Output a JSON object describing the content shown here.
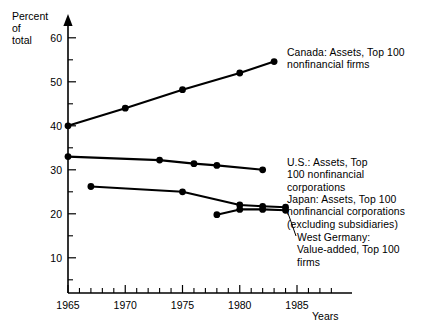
{
  "chart_data": {
    "type": "line",
    "title": "",
    "subtitle": "",
    "xlabel": "Years",
    "ylabel": "Percent\nof\ntotal",
    "xlim": [
      1964.2,
      1988.5
    ],
    "ylim": [
      2,
      62
    ],
    "grid": false,
    "legend_position": "right-inline-annotations",
    "y_ticks_major": [
      10,
      20,
      30,
      40,
      50,
      60
    ],
    "y_ticks_minor": [
      5,
      15,
      25,
      35,
      45,
      55
    ],
    "y_tick_labels": [
      "10",
      "20",
      "30",
      "40",
      "50",
      "60"
    ],
    "x_ticks_major": [
      1965,
      1970,
      1975,
      1980,
      1985
    ],
    "x_tick_labels": [
      "1965",
      "1970",
      "1975",
      "1980",
      "1985"
    ],
    "x_ticks_minor": [
      1966,
      1967,
      1968,
      1969,
      1971,
      1972,
      1973,
      1974,
      1976,
      1977,
      1978,
      1979,
      1981,
      1982,
      1983,
      1984,
      1986,
      1987,
      1988
    ],
    "series": [
      {
        "name": "Canada: Assets, Top 100 nonfinancial firms",
        "label": "Canada: Assets, Top 100\nnonfinancial firms",
        "color": "#000000",
        "x": [
          1965,
          1970,
          1975,
          1980,
          1983
        ],
        "values": [
          40.0,
          44.0,
          48.2,
          52.0,
          54.6
        ]
      },
      {
        "name": "U.S.: Assets, Top 100 nonfinancial corporations",
        "label": "U.S.: Assets, Top\n100 nonfinancial\ncorporations",
        "color": "#000000",
        "x": [
          1965,
          1973,
          1976,
          1978,
          1982
        ],
        "values": [
          33.0,
          32.2,
          31.4,
          31.0,
          30.0
        ]
      },
      {
        "name": "Japan: Assets, Top 100 nonfinancial corporations (excluding subsidiaries)",
        "label": "Japan: Assets, Top 100\nnonfinancial corporations\n(excluding subsidiaries)",
        "color": "#000000",
        "x": [
          1967,
          1975,
          1980,
          1982,
          1984
        ],
        "values": [
          26.2,
          25.0,
          22.0,
          21.7,
          21.5
        ]
      },
      {
        "name": "West Germany: Value-added, Top 100 firms",
        "label": "West Germany:\nValue-added, Top 100\nfirms",
        "color": "#000000",
        "x": [
          1978,
          1980,
          1982,
          1984
        ],
        "values": [
          19.8,
          21.0,
          21.0,
          20.8
        ]
      }
    ]
  },
  "annotations": {
    "canada": "Canada: Assets, Top 100\nnonfinancial firms",
    "us": "U.S.: Assets, Top\n100 nonfinancial\ncorporations",
    "japan": "Japan: Assets, Top 100\nnonfinancial corporations\n(excluding subsidiaries)",
    "west_germany": "West Germany:\nValue-added, Top 100\nfirms"
  },
  "axes": {
    "y_axis_title": "Percent\nof\ntotal",
    "x_axis_title": "Years"
  }
}
